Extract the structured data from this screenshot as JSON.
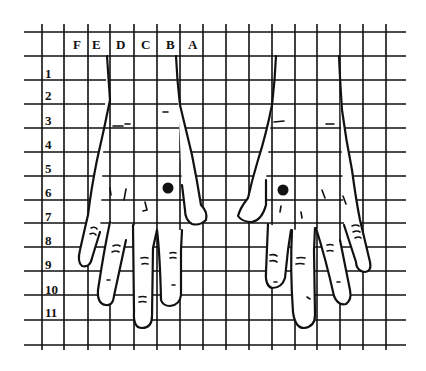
{
  "diagram": {
    "type": "hand-grid-chart",
    "column_labels": [
      "F",
      "E",
      "D",
      "C",
      "B",
      "A"
    ],
    "row_labels": [
      "1",
      "2",
      "3",
      "4",
      "5",
      "6",
      "7",
      "8",
      "9",
      "10",
      "11"
    ],
    "markers": [
      {
        "name": "left-hand-dot",
        "row": "6",
        "x": 168,
        "y": 188
      },
      {
        "name": "right-hand-dot",
        "row": "6",
        "x": 283,
        "y": 190
      }
    ],
    "colors": {
      "ink": "#111111",
      "background": "#ffffff"
    }
  }
}
